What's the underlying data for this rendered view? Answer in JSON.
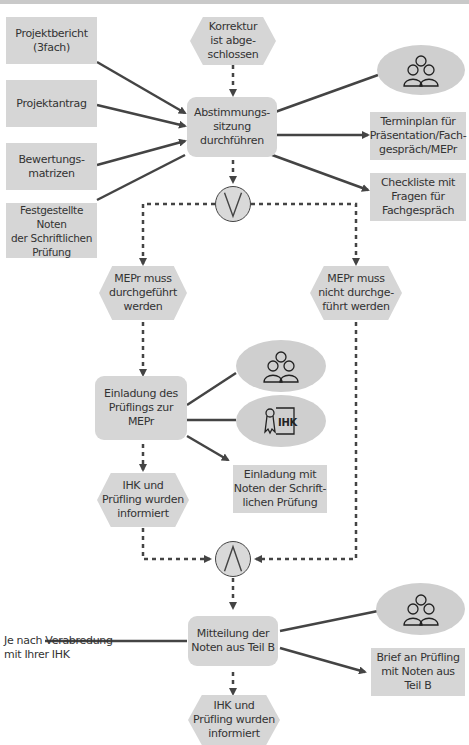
{
  "diagram": {
    "inputs": [
      {
        "id": "projektbericht",
        "label": "Projektbericht\n(3fach)"
      },
      {
        "id": "projektantrag",
        "label": "Projektantrag"
      },
      {
        "id": "bewertungsmatrizen",
        "label": "Bewertungs-\nmatrizen"
      },
      {
        "id": "noten",
        "label": "Festgestellte Noten\nder Schriftlichen\nPrüfung"
      }
    ],
    "events": {
      "korrektur": "Korrektur\nist abge-\nschlossen",
      "mepr_muss": "MEPr muss\ndurchgeführt\nwerden",
      "mepr_nicht": "MEPr muss\nnicht durchge-\nführt werden",
      "informiert_1": "IHK und\nPrüfling wurden\ninformiert",
      "informiert_2": "IHK und\nPrüfling wurden\ninformiert"
    },
    "functions": {
      "abstimmung": "Abstimmungs-\nsitzung\ndurchführen",
      "einladung": "Einladung des\nPrüflings zur\nMEPr",
      "mitteilung": "Mitteilung der\nNoten aus Teil B"
    },
    "outputs": {
      "terminplan": "Terminplan für\nPräsentation/Fach-\ngespräch/MEPr",
      "checkliste": "Checkliste mit\nFragen für\nFachgespräch",
      "einladung_noten": "Einladung mit\nNoten der Schrift-\nlichen Prüfung",
      "brief": "Brief an Prüfling\nmit Noten aus\nTeil B"
    },
    "annotation": "Je nach Verabredung\nmit Ihrer IHK",
    "connectors": {
      "xor": "XOR",
      "and": "AND"
    },
    "icons": {
      "group": "people-group-icon",
      "ihk": "ihk-certificate-icon"
    },
    "colors": {
      "box": "#d6d6d6",
      "line": "#444444",
      "text": "#333333"
    }
  }
}
